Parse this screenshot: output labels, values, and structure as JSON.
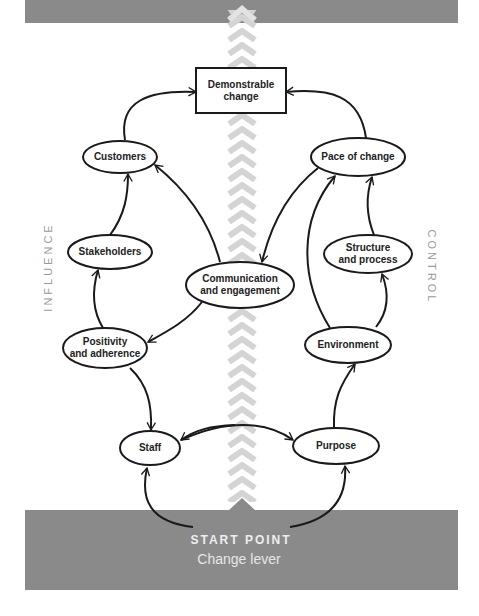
{
  "diagram": {
    "side_labels": {
      "left": "INFLUENCE",
      "right": "CONTROL"
    },
    "start": {
      "title": "START POINT",
      "subtitle": "Change lever"
    },
    "nodes": {
      "demonstrable_change": "Demonstrable change",
      "customers": "Customers",
      "pace_of_change": "Pace of change",
      "stakeholders": "Stakeholders",
      "communication": "Communication and engagement",
      "structure": "Structure and process",
      "positivity": "Positivity and adherence",
      "environment": "Environment",
      "staff": "Staff",
      "purpose": "Purpose"
    },
    "node_lines": {
      "demonstrable_change": [
        "Demonstrable",
        "change"
      ],
      "communication": [
        "Communication",
        "and engagement"
      ],
      "structure": [
        "Structure",
        "and process"
      ],
      "positivity": [
        "Positivity",
        "and adherence"
      ]
    },
    "edges": [
      [
        "start",
        "staff"
      ],
      [
        "start",
        "purpose"
      ],
      [
        "staff",
        "purpose"
      ],
      [
        "purpose",
        "staff"
      ],
      [
        "staff",
        "positivity"
      ],
      [
        "positivity",
        "stakeholders"
      ],
      [
        "stakeholders",
        "customers"
      ],
      [
        "customers",
        "demonstrable_change"
      ],
      [
        "communication",
        "customers"
      ],
      [
        "communication",
        "positivity"
      ],
      [
        "pace_of_change",
        "communication"
      ],
      [
        "purpose",
        "environment"
      ],
      [
        "environment",
        "structure"
      ],
      [
        "environment",
        "pace_of_change"
      ],
      [
        "structure",
        "pace_of_change"
      ],
      [
        "pace_of_change",
        "demonstrable_change"
      ]
    ],
    "colors": {
      "band": "#8a8a8a",
      "chevron": "#d4d4d4",
      "stroke": "#1a1a1a",
      "side_label": "#9a9a9a"
    }
  }
}
